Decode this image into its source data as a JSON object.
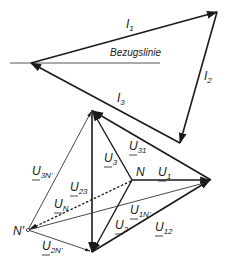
{
  "diagram": {
    "type": "phasor-diagram",
    "reference_line_label": "Bezugslinie",
    "current_triangle": {
      "labels": {
        "I1": {
          "main": "I",
          "sub": "1"
        },
        "I2": {
          "main": "I",
          "sub": "2"
        },
        "I3": {
          "main": "I",
          "sub": "3"
        }
      }
    },
    "voltage_diagram": {
      "points": {
        "N": "N",
        "N_prime": "N'"
      },
      "labels": {
        "U1": {
          "main": "U",
          "sub": "1"
        },
        "U2": {
          "main": "U",
          "sub": "2"
        },
        "U3": {
          "main": "U",
          "sub": "3"
        },
        "U12": {
          "main": "U",
          "sub": "12"
        },
        "U23": {
          "main": "U",
          "sub": "23"
        },
        "U31": {
          "main": "U",
          "sub": "31"
        },
        "UN": {
          "main": "U",
          "sub": "N"
        },
        "U1N": {
          "main": "U",
          "sub": "1N'"
        },
        "U2N": {
          "main": "U",
          "sub": "2N'"
        },
        "U3N": {
          "main": "U",
          "sub": "3N'"
        }
      }
    },
    "colors": {
      "line": "#1a1a1a",
      "thin_line": "#333333",
      "background": "#ffffff"
    }
  }
}
